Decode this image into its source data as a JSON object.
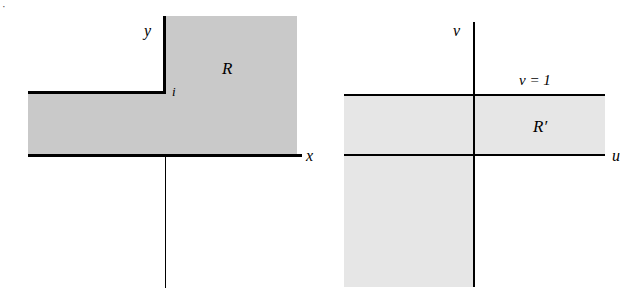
{
  "figure": {
    "kind": "complex-plane-mapping-diagram",
    "corner_mark": "·",
    "colors": {
      "region_z_fill": "#c9c9c9",
      "region_w_fill": "#e6e6e6",
      "line": "#000000",
      "background": "#ffffff"
    }
  },
  "z_plane": {
    "name": "z-plane",
    "axis_labels": {
      "horizontal": "x",
      "vertical": "y"
    },
    "region_label": "R",
    "point_label": "i",
    "description": "Shaded region R consists of the upper half plane to the right of the y-axis together with the horizontal strip 0 < y < 1 extending to the left; boundary drawn bold along y-axis above i, along the line y = 1 to the left of i, and along the x-axis."
  },
  "w_plane": {
    "name": "w-plane",
    "axis_labels": {
      "horizontal": "u",
      "vertical": "v"
    },
    "region_label": "R′",
    "boundary_label": {
      "variable": "v",
      "relation": "=",
      "value": "1"
    },
    "boundary_label_text": "v = 1",
    "description": "Shaded region R′ is the horizontal strip 0 < v < 1 extending to the right, together with the third quadrant u < 0, v < 0."
  }
}
